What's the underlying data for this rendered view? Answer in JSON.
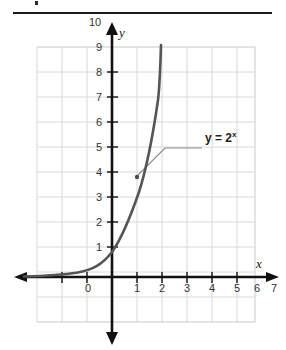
{
  "figure": {
    "title_rule": "horizontal-divider",
    "equation_label": "y = 2",
    "equation_exponent": "x",
    "axis_labels": {
      "x": "x",
      "y": "y"
    },
    "x_ticks": [
      "0",
      "1",
      "2",
      "3",
      "4",
      "5",
      "6",
      "7"
    ],
    "y_ticks": [
      "1",
      "2",
      "3",
      "4",
      "5",
      "6",
      "7",
      "8",
      "9",
      "10"
    ],
    "colors": {
      "curve": "#555555",
      "axis": "#111111",
      "grid": "#d8d8dd",
      "grid_border": "#c9c9cf",
      "text": "#333333",
      "rule": "#1a1a1a",
      "leader": "#8a8a8a"
    }
  },
  "chart_data": {
    "type": "line",
    "title": "",
    "xlabel": "x",
    "ylabel": "y",
    "xlim": [
      -3,
      7.7
    ],
    "ylim": [
      -2,
      11.4
    ],
    "grid": true,
    "legend": "none",
    "annotations": [
      {
        "text": "y = 2^x",
        "points_to_x": 2.1,
        "points_to_y": 4.3,
        "label_x": 4.4,
        "label_y": 6.4
      }
    ],
    "series": [
      {
        "name": "y = 2^x",
        "equation": "y = 2^x",
        "x": [
          -3,
          -2.5,
          -2,
          -1.5,
          -1,
          -0.5,
          0,
          0.5,
          1,
          1.5,
          2,
          2.5,
          3,
          3.3
        ],
        "y": [
          0.125,
          0.177,
          0.25,
          0.354,
          0.5,
          0.707,
          1,
          1.414,
          2,
          2.828,
          4,
          5.657,
          8,
          9.85
        ]
      }
    ],
    "key_points": [
      {
        "x": 0,
        "y": 1
      },
      {
        "x": 1,
        "y": 2
      },
      {
        "x": 2,
        "y": 4
      },
      {
        "x": 3,
        "y": 8
      }
    ]
  }
}
